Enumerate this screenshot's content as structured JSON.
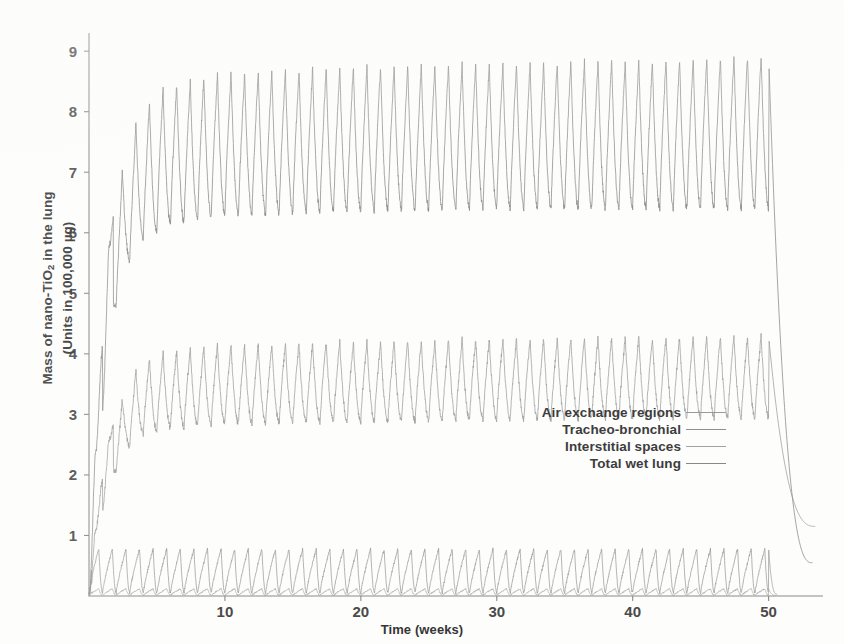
{
  "figure": {
    "background_color": "#fdfdfc"
  },
  "axes": {
    "x": {
      "title": "Time (weeks)",
      "ticks": [
        10,
        20,
        30,
        40,
        50
      ],
      "tick_labels": [
        "10",
        "20",
        "30",
        "40",
        "50"
      ],
      "range": [
        0,
        54
      ],
      "axis_color": "#8a8a8a"
    },
    "y": {
      "title_line1": "Mass of nano-TiO",
      "title_sub": "2",
      "title_line1_tail": " in the lung",
      "title_line2": "(Units in 100,000 µg)",
      "ticks": [
        1,
        2,
        3,
        4,
        5,
        6,
        7,
        8,
        9
      ],
      "tick_labels": [
        "1",
        "2",
        "3",
        "4",
        "5",
        "6",
        "7",
        "8",
        "9"
      ],
      "range": [
        0,
        9.3
      ],
      "axis_color": "#8a8a8a"
    }
  },
  "legend": {
    "position": "center-right",
    "entries": [
      {
        "label": "Air exchange regions",
        "color": "#9a9a9a"
      },
      {
        "label": "Tracheo-bronchial",
        "color": "#8f8f8f"
      },
      {
        "label": "Interstitial spaces",
        "color": "#a2a2a2"
      },
      {
        "label": "Total wet lung",
        "color": "#888888"
      }
    ]
  },
  "chart_data": {
    "type": "line",
    "title": "",
    "subtitle": "",
    "xlabel": "Time (weeks)",
    "ylabel": "Mass of nano-TiO2 in the lung (Units in 100,000 µg)",
    "xlim": [
      0,
      54
    ],
    "ylim": [
      0,
      9.3
    ],
    "grid": false,
    "legend_position": "center-right",
    "x_ticks": [
      10,
      20,
      30,
      40,
      50
    ],
    "y_ticks": [
      1,
      2,
      3,
      4,
      5,
      6,
      7,
      8,
      9
    ],
    "annotations": [
      "Exposure runs weeks 0-50 with weekly on/off cycling producing sawtooth oscillations",
      "After week 50 exposure stops and all compartments decay rapidly"
    ],
    "series": [
      {
        "name": "Total wet lung",
        "color": "#8c8c8c",
        "linewidth": 0.85,
        "description": "Uppermost band. Rises steeply from 0 to ~7.5 over first 3 weeks, plateaus oscillating between trough ~6.4 and peak ~8.8 each week, then decays after week 50.",
        "exposure_end_week": 50,
        "cycle_period_weeks": 1,
        "rise_time_weeks": 3,
        "plateau_peak": 8.8,
        "plateau_trough": 6.4,
        "start_value": 0.0,
        "decay_end_week": 53.2,
        "decay_end_value": 0.55,
        "jitter": 0.055,
        "peak_fraction": 0.45,
        "keypoints": [
          {
            "week": 0.0,
            "value": 0.0
          },
          {
            "week": 0.5,
            "value": 2.4
          },
          {
            "week": 1.0,
            "value": 4.1
          },
          {
            "week": 1.5,
            "value": 5.8
          },
          {
            "week": 2.0,
            "value": 6.6
          },
          {
            "week": 3.0,
            "value": 7.6
          },
          {
            "week": 4.0,
            "value": 8.1
          },
          {
            "week": 6.0,
            "value": 8.45
          },
          {
            "week": 10.0,
            "value": 8.65
          },
          {
            "week": 20.0,
            "value": 8.75
          },
          {
            "week": 30.0,
            "value": 8.8
          },
          {
            "week": 40.0,
            "value": 8.85
          },
          {
            "week": 50.0,
            "value": 8.95
          },
          {
            "week": 51.0,
            "value": 4.2
          },
          {
            "week": 52.0,
            "value": 1.8
          },
          {
            "week": 53.2,
            "value": 0.55
          }
        ]
      },
      {
        "name": "Interstitial spaces",
        "color": "#a0a0a0",
        "linewidth": 0.85,
        "description": "Middle band. Rises from 0 to ~3.4 over first 3 weeks, plateaus oscillating between trough ~2.95 and peak ~4.3, then decays after week 50.",
        "exposure_end_week": 50,
        "cycle_period_weeks": 1,
        "rise_time_weeks": 3,
        "plateau_peak": 4.3,
        "plateau_trough": 2.95,
        "start_value": 0.0,
        "decay_end_week": 53.4,
        "decay_end_value": 1.15,
        "jitter": 0.05,
        "peak_fraction": 0.45,
        "keypoints": [
          {
            "week": 0.0,
            "value": 0.0
          },
          {
            "week": 0.5,
            "value": 1.1
          },
          {
            "week": 1.0,
            "value": 1.9
          },
          {
            "week": 1.5,
            "value": 2.6
          },
          {
            "week": 2.0,
            "value": 3.0
          },
          {
            "week": 3.0,
            "value": 3.6
          },
          {
            "week": 4.0,
            "value": 3.9
          },
          {
            "week": 6.0,
            "value": 4.05
          },
          {
            "week": 10.0,
            "value": 4.15
          },
          {
            "week": 20.0,
            "value": 4.2
          },
          {
            "week": 30.0,
            "value": 4.25
          },
          {
            "week": 40.0,
            "value": 4.28
          },
          {
            "week": 50.0,
            "value": 4.3
          },
          {
            "week": 51.0,
            "value": 2.6
          },
          {
            "week": 52.0,
            "value": 1.7
          },
          {
            "week": 53.4,
            "value": 1.15
          }
        ]
      },
      {
        "name": "Air exchange regions",
        "color": "#999999",
        "linewidth": 0.8,
        "description": "Lowest band. Dense rapid square-like oscillation between ~0.05 and ~0.78 for the whole exposure period, drops to near zero immediately after week 50.",
        "exposure_end_week": 50,
        "cycle_period_weeks": 1,
        "rise_time_weeks": 0.3,
        "plateau_peak": 0.78,
        "plateau_trough": 0.05,
        "start_value": 0.0,
        "decay_end_week": 50.6,
        "decay_end_value": 0.03,
        "jitter": 0.02,
        "peak_fraction": 0.72,
        "keypoints": [
          {
            "week": 0.0,
            "value": 0.0
          },
          {
            "week": 0.3,
            "value": 0.78
          },
          {
            "week": 10.0,
            "value": 0.78
          },
          {
            "week": 25.0,
            "value": 0.78
          },
          {
            "week": 50.0,
            "value": 0.78
          },
          {
            "week": 50.4,
            "value": 0.08
          },
          {
            "week": 50.6,
            "value": 0.03
          }
        ]
      },
      {
        "name": "Tracheo-bronchial",
        "color": "#b0b0b0",
        "linewidth": 0.8,
        "description": "Lowest compartment, essentially overlapping the air exchange region band near the x-axis; extremely small mass.",
        "exposure_end_week": 50,
        "cycle_period_weeks": 1,
        "rise_time_weeks": 0.3,
        "plateau_peak": 0.12,
        "plateau_trough": 0.01,
        "start_value": 0.0,
        "decay_end_week": 50.5,
        "decay_end_value": 0.01,
        "jitter": 0.01,
        "peak_fraction": 0.72,
        "keypoints": [
          {
            "week": 0.0,
            "value": 0.0
          },
          {
            "week": 0.3,
            "value": 0.12
          },
          {
            "week": 25.0,
            "value": 0.12
          },
          {
            "week": 50.0,
            "value": 0.12
          },
          {
            "week": 50.5,
            "value": 0.01
          }
        ]
      }
    ]
  }
}
